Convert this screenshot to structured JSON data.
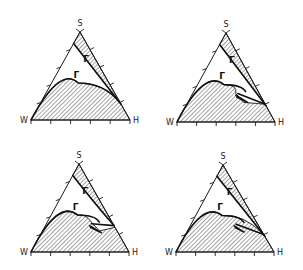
{
  "figure": {
    "vertex_labels": {
      "left": "W",
      "right": "H",
      "top": "S"
    },
    "phase_label": "Γ",
    "ticks_per_side": 4,
    "colors": {
      "ink": "#1a1a1a",
      "background": "#ffffff"
    },
    "panels": [
      {
        "id": "top-left",
        "variant": "tie-line meets solid curve at right edge"
      },
      {
        "id": "top-right",
        "variant": "small tongue between curves"
      },
      {
        "id": "bottom-left",
        "variant": "notched region with tongue"
      },
      {
        "id": "bottom-right",
        "variant": "tongue near right side of curve"
      }
    ]
  }
}
